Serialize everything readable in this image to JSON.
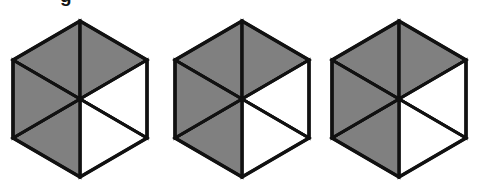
{
  "figure": {
    "title": "",
    "background_color": "#ffffff",
    "canvas": {
      "width": 477,
      "height": 192
    },
    "stroke_color": "#111111",
    "shaded_color": "#808080",
    "unshaded_color": "#ffffff",
    "stroke_width": 3,
    "shape_count": 3,
    "clipped_text": {
      "text": "g",
      "note": "partial letter descender clipped at top edge"
    }
  },
  "chart_data": {
    "type": "diagram",
    "title": "",
    "subtitle": "",
    "xlabel": "",
    "ylabel": "",
    "grid": false,
    "legend": "none",
    "shape": "hexagon",
    "orientation": "pointy-top",
    "segments_per_shape": 6,
    "segment_order": [
      "upper-left",
      "upper-right",
      "right",
      "lower-right",
      "lower-left",
      "left"
    ],
    "fill_legend": {
      "shaded": "#808080",
      "unshaded": "#ffffff"
    },
    "shapes": [
      {
        "id": "hexagon-1",
        "label": "Hexagon 1",
        "center": {
          "x": 80,
          "y": 99
        },
        "radius_x": 67,
        "radius_y": 78,
        "shaded_count": 4,
        "unshaded_count": 2,
        "segments": [
          {
            "name": "upper-left",
            "fill": "shaded"
          },
          {
            "name": "upper-right",
            "fill": "shaded"
          },
          {
            "name": "right",
            "fill": "unshaded"
          },
          {
            "name": "lower-right",
            "fill": "unshaded"
          },
          {
            "name": "lower-left",
            "fill": "shaded"
          },
          {
            "name": "left",
            "fill": "shaded"
          }
        ]
      },
      {
        "id": "hexagon-2",
        "label": "Hexagon 2",
        "center": {
          "x": 242,
          "y": 99
        },
        "radius_x": 67,
        "radius_y": 78,
        "shaded_count": 4,
        "unshaded_count": 2,
        "segments": [
          {
            "name": "upper-left",
            "fill": "shaded"
          },
          {
            "name": "upper-right",
            "fill": "shaded"
          },
          {
            "name": "right",
            "fill": "unshaded"
          },
          {
            "name": "lower-right",
            "fill": "unshaded"
          },
          {
            "name": "lower-left",
            "fill": "shaded"
          },
          {
            "name": "left",
            "fill": "shaded"
          }
        ]
      },
      {
        "id": "hexagon-3",
        "label": "Hexagon 3",
        "center": {
          "x": 399,
          "y": 99
        },
        "radius_x": 67,
        "radius_y": 78,
        "shaded_count": 4,
        "unshaded_count": 2,
        "segments": [
          {
            "name": "upper-left",
            "fill": "shaded"
          },
          {
            "name": "upper-right",
            "fill": "shaded"
          },
          {
            "name": "right",
            "fill": "unshaded"
          },
          {
            "name": "lower-right",
            "fill": "unshaded"
          },
          {
            "name": "lower-left",
            "fill": "shaded"
          },
          {
            "name": "left",
            "fill": "shaded"
          }
        ]
      }
    ]
  }
}
